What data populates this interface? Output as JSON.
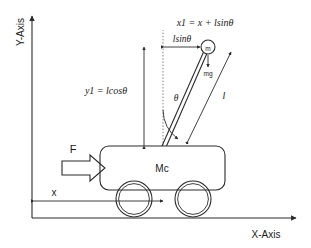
{
  "figure": {
    "axes": {
      "x_axis_label": "X-Axis",
      "y_axis_label": "Y-Axis"
    },
    "labels": {
      "x1_equation": "x1 = x + lsinθ",
      "lsin_theta": "lsinθ",
      "y1_equation": "y1 = lcosθ",
      "theta": "θ",
      "rod_length": "l",
      "bob_mass": "m",
      "weight_force": "mg",
      "cart_mass": "Mc",
      "applied_force": "F",
      "cart_position": "x"
    },
    "colors": {
      "ink": "#2b2b2b",
      "guide": "#7a7a7a",
      "background": "#ffffff"
    }
  }
}
